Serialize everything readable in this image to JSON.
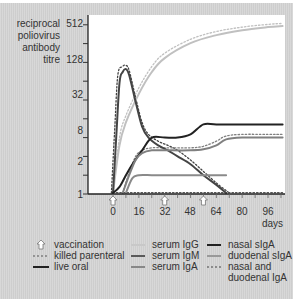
{
  "chart_data": {
    "type": "line",
    "title": "",
    "ylabel": "reciprocal poliovirus antibody titre",
    "xlabel": "days",
    "yscale": "log2",
    "ylim": [
      1,
      600
    ],
    "xlim": [
      -3,
      107
    ],
    "y_tick_labels": [
      "1",
      "2",
      "8",
      "32",
      "128",
      "512"
    ],
    "y_tick_values_all": [
      1,
      2,
      4,
      8,
      16,
      32,
      64,
      128,
      256,
      512
    ],
    "x_tick_labels": [
      "0",
      "16",
      "32",
      "48",
      "64",
      "80",
      "96"
    ],
    "grid": false,
    "vaccination_days": [
      0,
      32,
      56
    ],
    "series": [
      {
        "name": "serum IgG (live oral)",
        "style": "solid",
        "color": "#c0c0c0",
        "x": [
          0,
          4,
          8,
          16,
          24,
          32,
          48,
          64,
          80,
          96,
          105
        ],
        "y": [
          1,
          6,
          14,
          40,
          90,
          150,
          260,
          350,
          420,
          470,
          490
        ]
      },
      {
        "name": "serum IgG (killed parenteral)",
        "style": "dotted",
        "color": "#c0c0c0",
        "x": [
          0,
          4,
          8,
          16,
          24,
          32,
          48,
          64,
          80,
          96,
          105
        ],
        "y": [
          1,
          8,
          18,
          50,
          110,
          180,
          300,
          400,
          470,
          520,
          540
        ]
      },
      {
        "name": "serum IgM (live oral)",
        "style": "solid",
        "color": "#444444",
        "x": [
          0,
          2,
          4,
          6,
          8,
          10,
          14,
          18,
          22,
          28,
          34,
          40,
          48,
          56,
          64,
          70
        ],
        "y": [
          1,
          8,
          60,
          90,
          100,
          80,
          30,
          12,
          8,
          6,
          5,
          4,
          3,
          2,
          1.4,
          1
        ]
      },
      {
        "name": "serum IgM (killed parenteral)",
        "style": "dotted",
        "color": "#444444",
        "x": [
          -1,
          1,
          3,
          6,
          8,
          10,
          14,
          18,
          22,
          28,
          34,
          40,
          48,
          56,
          64,
          72
        ],
        "y": [
          1,
          10,
          80,
          110,
          115,
          95,
          35,
          14,
          9,
          7,
          6,
          5,
          3.5,
          2.3,
          1.5,
          1
        ]
      },
      {
        "name": "nasal sIgA (live oral)",
        "style": "solid",
        "color": "#222222",
        "x": [
          0,
          4,
          8,
          12,
          18,
          24,
          32,
          40,
          48,
          56,
          64,
          80,
          96,
          105
        ],
        "y": [
          1,
          1.3,
          2,
          3,
          5,
          8,
          8,
          8,
          9,
          13,
          13,
          13,
          13,
          13
        ]
      },
      {
        "name": "duodenal sIgA (live oral)",
        "style": "solid",
        "color": "#808080",
        "x": [
          6,
          10,
          14,
          18,
          24,
          32,
          48,
          56,
          64,
          70,
          80,
          96,
          105
        ],
        "y": [
          1,
          2,
          3.5,
          4.5,
          5,
          5,
          5,
          5.2,
          6,
          7.5,
          8,
          8,
          8
        ]
      },
      {
        "name": "serum IgA (live oral)",
        "style": "solid",
        "color": "#8a8a8a",
        "x": [
          8,
          12,
          16,
          24,
          32,
          48,
          64,
          70
        ],
        "y": [
          1,
          1.8,
          2,
          2,
          2,
          2,
          2,
          2
        ]
      },
      {
        "name": "nasal and duodenal IgA (killed parenteral)",
        "style": "dotted",
        "color": "#555555",
        "x": [
          0,
          16,
          32,
          48,
          64,
          80,
          96,
          105
        ],
        "y": [
          1.05,
          1.05,
          1.05,
          1.05,
          1.05,
          1.05,
          1.05,
          1.05
        ]
      },
      {
        "name": "duodenal sIgA (killed parenteral)",
        "style": "dotted",
        "color": "#808080",
        "x": [
          6,
          10,
          14,
          18,
          24,
          32,
          48,
          56,
          64,
          70,
          80,
          96,
          105
        ],
        "y": [
          1,
          2.2,
          4,
          5,
          5.5,
          5.5,
          5.5,
          5.8,
          7,
          8.5,
          9,
          9,
          9
        ]
      }
    ]
  },
  "axis": {
    "ylabel_lines": [
      "reciprocal",
      "poliovirus",
      "antibody",
      "titre"
    ],
    "yticks": [
      {
        "label": "512",
        "value": 512
      },
      {
        "label": "128",
        "value": 128
      },
      {
        "label": "32",
        "value": 32
      },
      {
        "label": "8",
        "value": 8
      },
      {
        "label": "2",
        "value": 2
      },
      {
        "label": "1",
        "value": 1
      }
    ],
    "xticks": [
      {
        "label": "0",
        "value": 0
      },
      {
        "label": "16",
        "value": 16
      },
      {
        "label": "32",
        "value": 32
      },
      {
        "label": "48",
        "value": 48
      },
      {
        "label": "64",
        "value": 64
      },
      {
        "label": "80",
        "value": 80
      },
      {
        "label": "96",
        "value": 96
      }
    ],
    "xunit": "days"
  },
  "legend": {
    "col1": [
      {
        "label": "vaccination",
        "kind": "arrow"
      },
      {
        "label": "killed parenteral",
        "kind": "dotted"
      },
      {
        "label": "live oral",
        "kind": "solid-black"
      }
    ],
    "col2": [
      {
        "label": "serum IgG",
        "kind": "solid",
        "color": "#c8c8c8"
      },
      {
        "label": "serum IgM",
        "kind": "solid",
        "color": "#5a5a5a"
      },
      {
        "label": "serum IgA",
        "kind": "solid",
        "color": "#888888"
      }
    ],
    "col3": [
      {
        "label": "nasal sIgA",
        "kind": "solid",
        "color": "#222222"
      },
      {
        "label": "duodenal sIgA",
        "kind": "solid",
        "color": "#999999"
      },
      {
        "label": "nasal and",
        "kind": "dotted",
        "color": "#444444"
      },
      {
        "label": "duodenal IgA",
        "kind": "none"
      }
    ]
  }
}
